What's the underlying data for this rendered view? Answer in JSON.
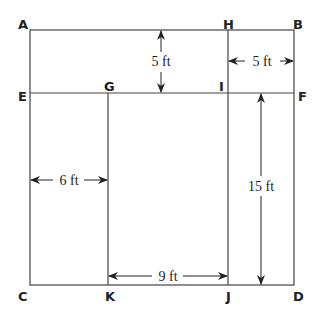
{
  "points": {
    "A": {
      "label": "A",
      "x": 18,
      "y": 22
    },
    "H": {
      "label": "H",
      "x": 222,
      "y": 22
    },
    "B": {
      "label": "B",
      "x": 293,
      "y": 22
    },
    "E": {
      "label": "E",
      "x": 18,
      "y": 98
    },
    "G": {
      "label": "G",
      "x": 104,
      "y": 90
    },
    "I": {
      "label": "I",
      "x": 218,
      "y": 90
    },
    "F": {
      "label": "F",
      "x": 297,
      "y": 98
    },
    "C": {
      "label": "C",
      "x": 18,
      "y": 301
    },
    "K": {
      "label": "K",
      "x": 104,
      "y": 301
    },
    "J": {
      "label": "J",
      "x": 226,
      "y": 301
    },
    "D": {
      "label": "D",
      "x": 293,
      "y": 301
    }
  },
  "dimensions": {
    "AE": "5 ft",
    "HB": "5 ft",
    "EG": "6 ft",
    "IJ": "15 ft",
    "KJ": "9 ft"
  },
  "colors": {
    "line": "#444444",
    "text": "#222222"
  }
}
